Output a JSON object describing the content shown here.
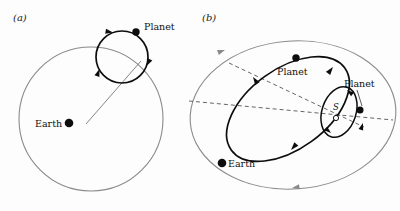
{
  "figure": {
    "background_color": "#fdfdfd",
    "ink_color": "#0d0d0d",
    "gray_orbit_color": "#8a8a8a"
  },
  "panels": [
    {
      "id": "a",
      "label": "(a)",
      "model": "Ptolemaic epicycle-on-deferent",
      "labels": {
        "earth": "Earth",
        "planet": "Planet"
      },
      "geometry": {
        "deferent": {
          "cx": 91,
          "cy": 119,
          "r": 72,
          "color": "#8a8a8a"
        },
        "epicycle": {
          "cx": 122,
          "cy": 57,
          "r": 26,
          "color": "#0d0d0d"
        },
        "earth_dot": {
          "cx": 69,
          "cy": 123,
          "r": 4.2
        },
        "planet_dot": {
          "cx": 136,
          "cy": 32,
          "r": 3.6
        },
        "radius_line": {
          "x1": 86,
          "y1": 124,
          "x2": 140,
          "y2": 62
        }
      }
    },
    {
      "id": "b",
      "label": "(b)",
      "model": "Copernican heliocentric ellipses",
      "labels": {
        "earth": "Earth",
        "planet_outer": "Planet",
        "planet_inner": "Planet",
        "sun": "S"
      },
      "geometry": {
        "earth_orbit": {
          "cx": 293,
          "cy": 115,
          "rx": 103,
          "ry": 74,
          "rot": -4,
          "color": "#8a8a8a"
        },
        "planet_orbit_outer": {
          "cx": 288,
          "cy": 109,
          "rx": 70,
          "ry": 40,
          "rot": -36,
          "color": "#0d0d0d"
        },
        "planet_orbit_inner": {
          "cx": 339,
          "cy": 112,
          "rx": 26,
          "ry": 17,
          "rot": -72,
          "color": "#0d0d0d"
        },
        "sun_marker": {
          "cx": 336,
          "cy": 118,
          "r": 2.6
        },
        "earth_dot": {
          "cx": 222,
          "cy": 163,
          "r": 4.2
        },
        "planet_dot_outer": {
          "cx": 296,
          "cy": 58,
          "r": 3.6
        },
        "planet_dot_inner": {
          "cx": 358,
          "cy": 110,
          "r": 3.4
        },
        "dashed_line_horizontal": {
          "x1": 189,
          "y1": 101,
          "x2": 393,
          "y2": 120
        },
        "dashed_line_major_axis": {
          "x1": 228,
          "y1": 62,
          "x2": 363,
          "y2": 126
        },
        "leader_line": {
          "x1": 357,
          "y1": 92,
          "x2": 362,
          "y2": 107
        }
      }
    }
  ]
}
